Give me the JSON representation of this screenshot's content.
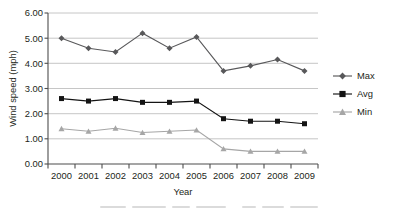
{
  "chart_data": {
    "type": "line",
    "title": "",
    "xlabel": "Year",
    "ylabel": "Wind speed (mph)",
    "categories": [
      "2000",
      "2001",
      "2002",
      "2003",
      "2004",
      "2005",
      "2006",
      "2007",
      "2008",
      "2009"
    ],
    "series": [
      {
        "name": "Max",
        "color": "#58585a",
        "marker": "diamond",
        "values": [
          5.0,
          4.6,
          4.45,
          5.2,
          4.6,
          5.05,
          3.7,
          3.9,
          4.15,
          3.7
        ]
      },
      {
        "name": "Avg",
        "color": "#141414",
        "marker": "square",
        "values": [
          2.6,
          2.5,
          2.6,
          2.45,
          2.45,
          2.5,
          1.8,
          1.7,
          1.7,
          1.6
        ]
      },
      {
        "name": "Min",
        "color": "#a6a6a6",
        "marker": "triangle",
        "values": [
          1.4,
          1.3,
          1.42,
          1.25,
          1.3,
          1.35,
          0.6,
          0.5,
          0.5,
          0.5
        ]
      }
    ],
    "ylim": [
      0.0,
      6.0
    ],
    "y_ticks": [
      "0.00",
      "1.00",
      "2.00",
      "3.00",
      "4.00",
      "5.00",
      "6.00"
    ],
    "grid": true,
    "legend_position": "right"
  },
  "legend": {
    "entries": [
      {
        "label": "Max"
      },
      {
        "label": "Avg"
      },
      {
        "label": "Min"
      }
    ]
  },
  "axes": {
    "y_title": "Wind speed (mph)",
    "x_title": "Year"
  }
}
